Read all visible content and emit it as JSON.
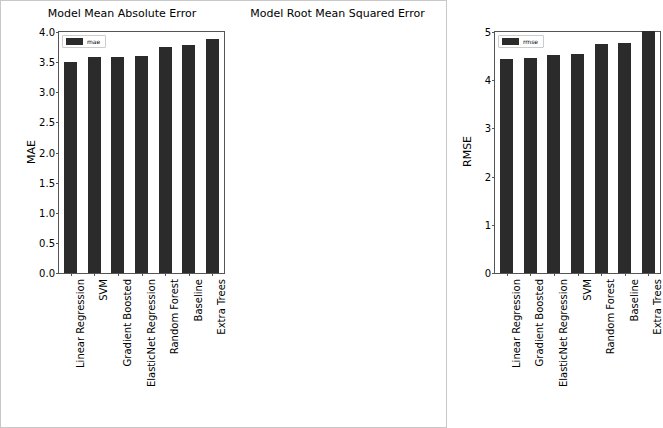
{
  "figure": {
    "width": 447,
    "height": 428,
    "background": "#ffffff",
    "bar_color": "#2b2b2b",
    "axis_color": "#555555"
  },
  "chart_data": [
    {
      "type": "bar",
      "id": "mae",
      "title": "Model Mean Absolute Error",
      "xlabel": "",
      "ylabel": "MAE",
      "legend": [
        "mae"
      ],
      "legend_position": "upper left",
      "grid": false,
      "ylim": [
        0.0,
        4.0
      ],
      "yticks": [
        "0.0",
        "0.5",
        "1.0",
        "1.5",
        "2.0",
        "2.5",
        "3.0",
        "3.5",
        "4.0"
      ],
      "ytick_values": [
        0.0,
        0.5,
        1.0,
        1.5,
        2.0,
        2.5,
        3.0,
        3.5,
        4.0
      ],
      "categories": [
        "Linear Regression",
        "SVM",
        "Gradient Boosted",
        "ElasticNet Regression",
        "Random Forest",
        "Baseline",
        "Extra Trees"
      ],
      "values": [
        3.51,
        3.58,
        3.59,
        3.6,
        3.75,
        3.78,
        3.88
      ]
    },
    {
      "type": "bar",
      "id": "rmse",
      "title": "Model Root Mean Squared Error",
      "xlabel": "",
      "ylabel": "RMSE",
      "legend": [
        "rmse"
      ],
      "legend_position": "upper left",
      "grid": false,
      "ylim": [
        0,
        5
      ],
      "yticks": [
        "0",
        "1",
        "2",
        "3",
        "4",
        "5"
      ],
      "ytick_values": [
        0,
        1,
        2,
        3,
        4,
        5
      ],
      "categories": [
        "Linear Regression",
        "Gradient Boosted",
        "ElasticNet Regression",
        "SVM",
        "Random Forest",
        "Baseline",
        "Extra Trees"
      ],
      "values": [
        4.45,
        4.47,
        4.53,
        4.54,
        4.76,
        4.78,
        5.03
      ]
    }
  ]
}
